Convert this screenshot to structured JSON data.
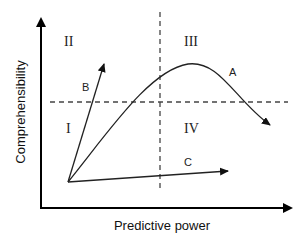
{
  "diagram": {
    "x_axis_label": "Predictive power",
    "y_axis_label": "Comprehensibility",
    "quadrants": {
      "top_left": "II",
      "top_right": "III",
      "bottom_left": "I",
      "bottom_right": "IV"
    },
    "curves": {
      "a": "A",
      "b": "B",
      "c": "C"
    },
    "colors": {
      "axis": "#000000",
      "lines": "#333333",
      "dashed": "#444444",
      "text": "#222222",
      "background": "#ffffff"
    }
  }
}
